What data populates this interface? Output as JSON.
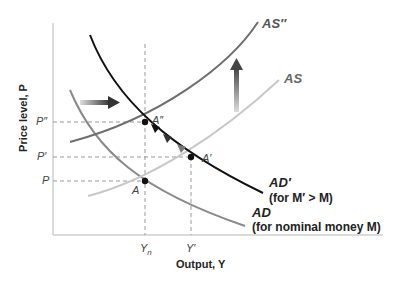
{
  "axes": {
    "y_label": "Price level, P",
    "x_label": "Output, Y"
  },
  "y_ticks": {
    "p_double_prime": "P″",
    "p_prime": "P′",
    "p": "P"
  },
  "x_ticks": {
    "y_n": "Yn",
    "y_prime": "Y′"
  },
  "points": {
    "a": "A",
    "a_prime": "A′",
    "a_double_prime": "A″"
  },
  "curves": {
    "as_double_prime": "AS″",
    "as": "AS",
    "ad_prime": "AD′",
    "ad_prime_note": "(for M′ > M)",
    "ad": "AD",
    "ad_note": "(for nominal money M)"
  },
  "colors": {
    "ad_prime": "#111111",
    "ad": "#8a8a8a",
    "as_double_prime": "#6e6e6e",
    "as": "#c8c8c8",
    "axis": "#cfcfcf"
  }
}
